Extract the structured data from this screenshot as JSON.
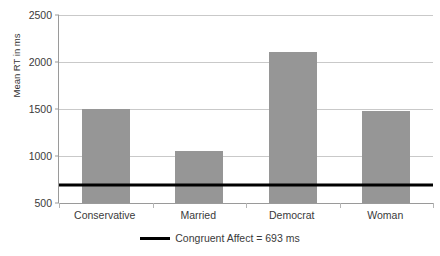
{
  "chart_data": {
    "type": "bar",
    "title": "",
    "xlabel": "",
    "ylabel": "Mean RT in ms",
    "categories": [
      "Conservative",
      "Married",
      "Democrat",
      "Woman"
    ],
    "values": [
      1500,
      1050,
      2110,
      1480
    ],
    "series": [
      {
        "name": "Mean RT",
        "values": [
          1500,
          1050,
          2110,
          1480
        ],
        "color": "#969696"
      }
    ],
    "ylim": [
      500,
      2500
    ],
    "yticks": [
      500,
      1000,
      1500,
      2000,
      2500
    ],
    "ytick_labels": [
      "500",
      "1000",
      "1500",
      "2000",
      "2500"
    ],
    "grid": true,
    "legend_position": "bottom",
    "reference_line": {
      "label": "Congruent Affect = 693 ms",
      "value": 693,
      "color": "#000000"
    },
    "bar_color": "#969696",
    "axis_color": "#9a9a9a",
    "gridline_color": "#c9c9c9"
  },
  "legend": {
    "entry_label": "Congruent Affect = 693 ms",
    "swatch_name": "reference-line-swatch"
  }
}
